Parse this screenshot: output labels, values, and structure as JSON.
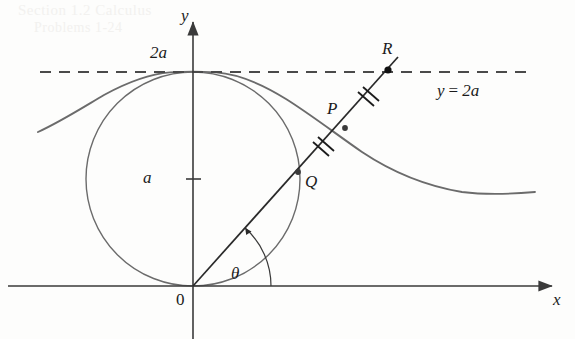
{
  "figure": {
    "colors": {
      "axis": "#3a3a3a",
      "curve": "#6b6b6b",
      "circle": "#6b6b6b",
      "ray": "#2a2a2a",
      "dashed": "#4a4a4a",
      "label": "#1b1b1b",
      "point_fill": "#1b1b1b",
      "bleed_text": "#f2f1ef",
      "background": "#fdfdfc"
    },
    "axes": {
      "x_label": "x",
      "y_label": "y",
      "origin_label": "0",
      "x_axis": {
        "x1": 8,
        "y1": 286,
        "x2": 557,
        "y2": 286
      },
      "y_axis": {
        "x1": 193,
        "y1": 339,
        "x2": 193,
        "y2": 16
      }
    },
    "tick_labels": [
      {
        "name": "y-tick-2a",
        "text": "2a",
        "x": 150,
        "y": 44
      },
      {
        "name": "y-tick-a",
        "text": "a",
        "x": 143,
        "y": 169
      }
    ],
    "asymptote": {
      "label": "y = 2a",
      "label_lhs": "y",
      "label_eq": "=",
      "label_rhs": "2a",
      "y": 72,
      "x_start": 40,
      "x_end": 530,
      "dash_pattern": "11 8"
    },
    "circle": {
      "name": "generating-circle",
      "cx": 193,
      "cy": 179,
      "r": 107,
      "description": "circle of diameter 2a tangent to x-axis at origin and to the line y = 2a"
    },
    "curve": {
      "name": "witch-of-agnesi-curve",
      "description": "y = 8a^3 / (x^2 + 4a^2), peak at (0, 2a)",
      "peak": {
        "x": 193,
        "y": 72
      },
      "x_min": 38,
      "x_max": 535
    },
    "ray": {
      "name": "ray-from-origin",
      "from": {
        "x": 193,
        "y": 286
      },
      "to": {
        "x": 398,
        "y": 57
      },
      "angle_label": "θ"
    },
    "points": [
      {
        "id": "Q",
        "label": "Q",
        "x": 298,
        "y": 172,
        "on": "circle",
        "label_x": 305,
        "label_y": 173
      },
      {
        "id": "P",
        "label": "P",
        "x": 345,
        "y": 128,
        "on": "curve",
        "label_x": 327,
        "label_y": 100
      },
      {
        "id": "R",
        "label": "R",
        "x": 388,
        "y": 70,
        "on": "asymptote",
        "label_x": 382,
        "label_y": 40
      }
    ],
    "tick_marks": [
      {
        "name": "congruence-ticks-QP",
        "segment": "QP",
        "count": 2,
        "x": 322,
        "y": 150
      },
      {
        "name": "congruence-ticks-PR",
        "segment": "PR",
        "count": 2,
        "x": 367,
        "y": 99
      }
    ],
    "angle_arc": {
      "name": "theta-arc",
      "center": {
        "x": 193,
        "y": 286
      },
      "radius": 78,
      "start_deg": 0,
      "end_deg": 48,
      "label": "θ",
      "label_x": 231,
      "label_y": 265
    },
    "bleed_through_text": {
      "line1": "Section 1.2  Calculus",
      "line2": "Problems  1-24"
    }
  }
}
